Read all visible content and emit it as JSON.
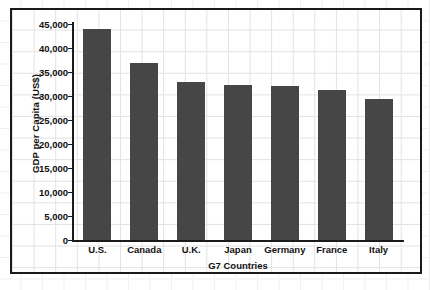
{
  "chart_data": {
    "type": "bar",
    "title": "",
    "xlabel": "G7 Countries",
    "ylabel": "GDP per Capita (US$)",
    "categories": [
      "U.S.",
      "Canada",
      "U.K.",
      "Japan",
      "Germany",
      "France",
      "Italy"
    ],
    "values": [
      44000,
      36800,
      33000,
      32200,
      32000,
      31200,
      29300
    ],
    "ylim": [
      0,
      45000
    ],
    "ytick_values": [
      0,
      5000,
      10000,
      15000,
      20000,
      25000,
      30000,
      35000,
      40000,
      45000
    ],
    "ytick_labels": [
      "0",
      "5,000",
      "10,000",
      "15,000",
      "20,000",
      "25,000",
      "30,000",
      "35,000",
      "40,000",
      "45,000"
    ],
    "grid": true,
    "legend": null,
    "bar_color": "#464646",
    "axis_color": "#1a1a1a",
    "grid_color": "#e2e2e2",
    "plot_background": "#ffffff"
  }
}
